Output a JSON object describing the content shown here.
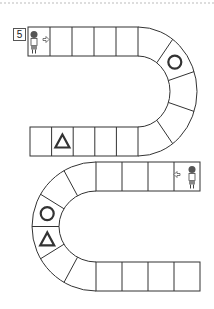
{
  "page": {
    "number": "5",
    "divider": "dashed-top-border"
  },
  "board": {
    "title": "path-tracing-board",
    "line_color": "#333333",
    "shape_color": "#333333",
    "segments": [
      {
        "name": "top-row",
        "cells": 5,
        "direction": "left-to-right"
      },
      {
        "name": "right-curve",
        "cells": 5
      },
      {
        "name": "middle-row",
        "cells": 5,
        "direction": "right-to-left"
      },
      {
        "name": "upper-right-row",
        "cells": 4
      },
      {
        "name": "left-curve",
        "cells": 6
      },
      {
        "name": "bottom-row",
        "cells": 4
      }
    ],
    "markers": [
      {
        "segment": "top-row",
        "cell": 0,
        "type": "character-girl",
        "arrow": "right-arrow"
      },
      {
        "segment": "right-curve",
        "cell": 1,
        "type": "circle"
      },
      {
        "segment": "middle-row",
        "cell": 1,
        "type": "triangle"
      },
      {
        "segment": "upper-right-row",
        "cell": 3,
        "type": "character-boy",
        "arrow": "left-arrow"
      },
      {
        "segment": "left-curve",
        "cell": 2,
        "type": "circle"
      },
      {
        "segment": "left-curve",
        "cell": 3,
        "type": "triangle"
      }
    ]
  }
}
